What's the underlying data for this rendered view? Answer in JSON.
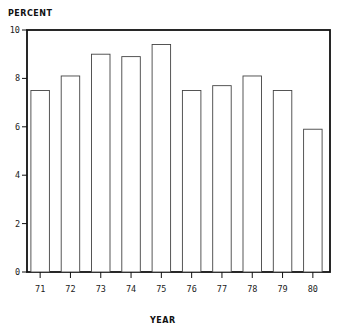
{
  "chart_data": {
    "type": "bar",
    "title": "",
    "xlabel": "YEAR",
    "ylabel": "PERCENT",
    "categories": [
      "71",
      "72",
      "73",
      "74",
      "75",
      "76",
      "77",
      "78",
      "79",
      "80"
    ],
    "values": [
      7.5,
      8.1,
      9.0,
      8.9,
      9.4,
      7.5,
      7.7,
      8.1,
      7.5,
      5.9
    ],
    "ylim": [
      0,
      10
    ],
    "yticks": [
      "0",
      "2",
      "4",
      "6",
      "8",
      "10"
    ],
    "grid": false,
    "legend": null,
    "bar_style": "outlined, white fill"
  }
}
